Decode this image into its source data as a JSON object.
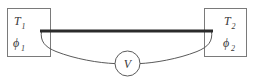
{
  "figure": {
    "name": "thermoelectric-circuit-diagram",
    "background_color": "#ffffff"
  },
  "left_reservoir": {
    "name": "left-reservoir-box",
    "temperature_symbol": "T",
    "temperature_subscript": "1",
    "potential_symbol": "ϕ",
    "potential_subscript": "1",
    "stroke_color": "#7a7a7a"
  },
  "right_reservoir": {
    "name": "right-reservoir-box",
    "temperature_symbol": "T",
    "temperature_subscript": "2",
    "potential_symbol": "ϕ",
    "potential_subscript": "2",
    "stroke_color": "#7a7a7a"
  },
  "conductor_bar": {
    "name": "conductor-bar",
    "color": "#2b2b2b",
    "thickness_px": 3
  },
  "voltmeter": {
    "name": "voltmeter",
    "label": "V",
    "stroke_color": "#5a5a5a"
  },
  "lead_wires": {
    "name": "lead-wires",
    "color": "#5a5a5a",
    "thickness_px": 1
  }
}
